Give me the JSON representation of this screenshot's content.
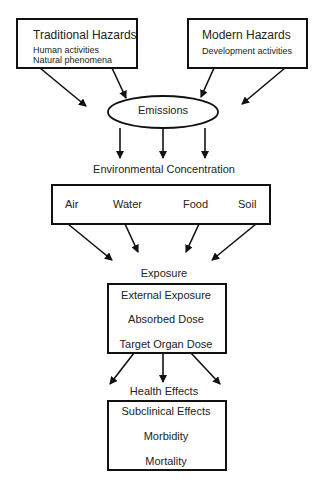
{
  "traditional": {
    "title": "Traditional Hazards",
    "items": [
      "Human activities",
      "Natural phenomena"
    ]
  },
  "modern": {
    "title": "Modern Hazards",
    "items": [
      "Development activities"
    ]
  },
  "emissions": {
    "label": "Emissions"
  },
  "environment": {
    "label": "Environmental Concentration",
    "media": [
      "Air",
      "Water",
      "Food",
      "Soil"
    ]
  },
  "exposure": {
    "label": "Exposure",
    "steps": [
      "External Exposure",
      "Absorbed Dose",
      "Target Organ Dose"
    ]
  },
  "health": {
    "label": "Health Effects",
    "steps": [
      "Subclinical Effects",
      "Morbidity",
      "Mortality"
    ]
  }
}
